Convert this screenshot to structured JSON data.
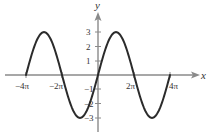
{
  "chart_data": {
    "type": "line",
    "title": "",
    "xlabel": "x",
    "ylabel": "y",
    "function": "y = 3 sin(x/2)",
    "xlim": [
      "-4π",
      "4π"
    ],
    "ylim": [
      -3,
      3
    ],
    "grid": false,
    "legend": null,
    "x_ticks": [
      {
        "label": "−4π",
        "value": -12.566
      },
      {
        "label": "−2π",
        "value": -6.283
      },
      {
        "label": "2π",
        "value": 6.283
      },
      {
        "label": "4π",
        "value": 12.566
      }
    ],
    "y_ticks": [
      {
        "label": "3",
        "value": 3
      },
      {
        "label": "2",
        "value": 2
      },
      {
        "label": "1",
        "value": 1
      },
      {
        "label": "−1",
        "value": -1
      },
      {
        "label": "−2",
        "value": -2
      },
      {
        "label": "−3",
        "value": -3
      }
    ],
    "series": [
      {
        "name": "curve",
        "x": [
          "-4π",
          "-3π",
          "-2π",
          "-π",
          "0",
          "π",
          "2π",
          "3π",
          "4π"
        ],
        "values": [
          0,
          3,
          0,
          -3,
          0,
          3,
          0,
          -3,
          0
        ]
      }
    ]
  },
  "colors": {
    "curve": "#2b2b2b",
    "axis": "#8a8a8a",
    "text": "#333333"
  }
}
